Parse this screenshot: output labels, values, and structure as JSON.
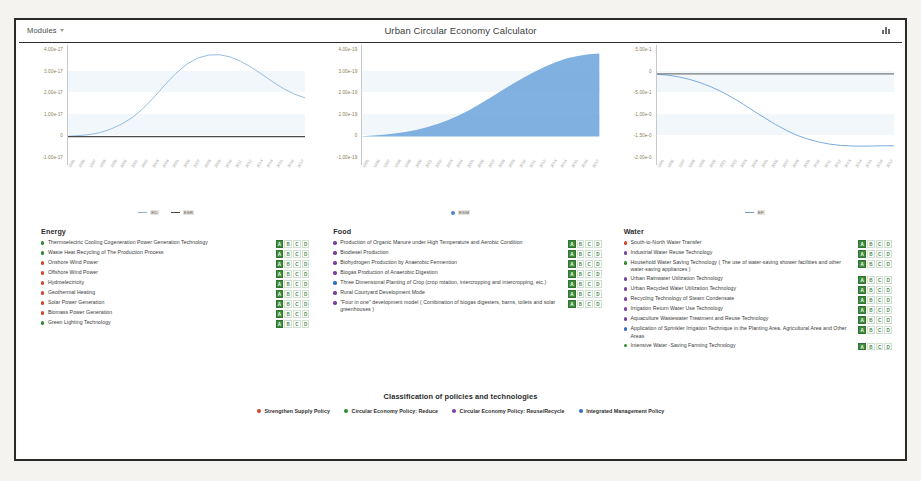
{
  "window": {
    "modules_label": "Modules",
    "title": "Urban Circular Economy Calculator",
    "topright_icon": "chart-icon"
  },
  "chart_data": [
    {
      "type": "line",
      "title": "",
      "xlabel": "",
      "ylabel": "",
      "ytick_labels": [
        "4.00e-17",
        "3.00e-17",
        "2.00e-17",
        "1.00e-17",
        "0",
        "-1.00e-17"
      ],
      "ylim": [
        -1e-17,
        4.3e-17
      ],
      "x": [
        "1995",
        "1996",
        "1997",
        "1998",
        "1999",
        "2000",
        "2001",
        "2002",
        "2003",
        "2004",
        "2005",
        "2006",
        "2007",
        "2008",
        "2009",
        "2010",
        "2011",
        "2012",
        "2013",
        "2014",
        "2015",
        "2016",
        "2017"
      ],
      "legend": [
        {
          "name": "ED",
          "color": "#8ab4dd",
          "marker": "line"
        },
        {
          "name": "ESR",
          "color": "#4a4a4a",
          "marker": "line"
        }
      ],
      "series": [
        {
          "name": "ED",
          "color": "#8ab4dd",
          "values": [
            2e-19,
            5e-19,
            1e-18,
            2e-18,
            3.8e-18,
            6.2e-18,
            9.5e-18,
            1.4e-17,
            1.95e-17,
            2.55e-17,
            3.1e-17,
            3.55e-17,
            3.85e-17,
            4e-17,
            4.02e-17,
            3.92e-17,
            3.7e-17,
            3.4e-17,
            3.05e-17,
            2.68e-17,
            2.35e-17,
            2.08e-17,
            1.9e-17
          ]
        },
        {
          "name": "ESR",
          "color": "#4a4a4a",
          "values": [
            0,
            0,
            0,
            0,
            0,
            0,
            0,
            0,
            0,
            0,
            0,
            0,
            0,
            0,
            0,
            0,
            0,
            0,
            0,
            0,
            0,
            0,
            0
          ]
        }
      ],
      "grid": false,
      "legend_position": "bottom"
    },
    {
      "type": "area",
      "title": "",
      "xlabel": "",
      "ylabel": "",
      "ytick_labels": [
        "4.00e-19",
        "3.00e-19",
        "2.00e-19",
        "1.00e-19",
        "0",
        "-1.00e-19"
      ],
      "ylim": [
        -1e-19,
        4.3e-19
      ],
      "x": [
        "1995",
        "1996",
        "1997",
        "1998",
        "1999",
        "2000",
        "2001",
        "2002",
        "2003",
        "2004",
        "2005",
        "2006",
        "2007",
        "2008",
        "2009",
        "2010",
        "2011",
        "2012",
        "2013",
        "2014",
        "2015",
        "2016",
        "2017"
      ],
      "legend": [
        {
          "name": "ESM",
          "color": "#4a86c8",
          "marker": "dot"
        }
      ],
      "series": [
        {
          "name": "ESM",
          "color": "#6ba3da",
          "values": [
            2e-21,
            5e-21,
            9e-21,
            1.5e-20,
            2.3e-20,
            3.3e-20,
            4.6e-20,
            6.2e-20,
            8.2e-20,
            1.05e-19,
            1.32e-19,
            1.62e-19,
            1.95e-19,
            2.28e-19,
            2.6e-19,
            2.9e-19,
            3.18e-19,
            3.44e-19,
            3.66e-19,
            3.84e-19,
            3.96e-19,
            4.04e-19,
            4.08e-19
          ]
        }
      ],
      "grid": false,
      "legend_position": "bottom"
    },
    {
      "type": "line",
      "title": "",
      "xlabel": "",
      "ylabel": "",
      "ytick_labels": [
        "5.00e-1",
        "0",
        "-5.00e-1",
        "-1.00e-0",
        "-1.50e-0",
        "-2.00e-0"
      ],
      "ylim": [
        -2.0,
        0.6
      ],
      "x": [
        "1995",
        "1996",
        "1997",
        "1998",
        "1999",
        "2000",
        "2001",
        "2002",
        "2003",
        "2004",
        "2005",
        "2006",
        "2007",
        "2008",
        "2009",
        "2010",
        "2011",
        "2012",
        "2013",
        "2014",
        "2015",
        "2016",
        "2017"
      ],
      "legend": [
        {
          "name": "EF",
          "color": "#6b9bd2",
          "marker": "line"
        }
      ],
      "series": [
        {
          "name": "EF",
          "color": "#6ba3da",
          "values": [
            -0.01,
            -0.03,
            -0.07,
            -0.13,
            -0.21,
            -0.31,
            -0.43,
            -0.57,
            -0.73,
            -0.9,
            -1.06,
            -1.22,
            -1.36,
            -1.48,
            -1.57,
            -1.64,
            -1.69,
            -1.72,
            -1.735,
            -1.74,
            -1.735,
            -1.73,
            -1.73
          ]
        },
        {
          "name": "zero-baseline",
          "color": "#7a7a7a",
          "values": [
            0,
            0,
            0,
            0,
            0,
            0,
            0,
            0,
            0,
            0,
            0,
            0,
            0,
            0,
            0,
            0,
            0,
            0,
            0,
            0,
            0,
            0,
            0
          ]
        }
      ],
      "grid": false,
      "legend_position": "bottom"
    }
  ],
  "categories": [
    {
      "name": "Energy",
      "items": [
        {
          "label": "Thermoelectric Cooling Cogeneration Power Generation Technology",
          "dot": "#2e8b2e",
          "badges": [
            "A",
            "B",
            "C",
            "D"
          ],
          "active": "A"
        },
        {
          "label": "Waste Heat Recycling of The Production Process",
          "dot": "#2e8b2e",
          "badges": [
            "A",
            "B",
            "C",
            "D"
          ],
          "active": "A"
        },
        {
          "label": "Onshore Wind Power",
          "dot": "#d1452b",
          "badges": [
            "A",
            "B",
            "C",
            "D"
          ],
          "active": "A"
        },
        {
          "label": "Offshore Wind Power",
          "dot": "#d1452b",
          "badges": [
            "A",
            "B",
            "C",
            "D"
          ],
          "active": "A"
        },
        {
          "label": "Hydroelectricity",
          "dot": "#d1452b",
          "badges": [
            "A",
            "B",
            "C",
            "D"
          ],
          "active": "A"
        },
        {
          "label": "Geothermal Heating",
          "dot": "#d1452b",
          "badges": [
            "A",
            "B",
            "C",
            "D"
          ],
          "active": "A"
        },
        {
          "label": "Solar Power Generation",
          "dot": "#d1452b",
          "badges": [
            "A",
            "B",
            "C",
            "D"
          ],
          "active": "A"
        },
        {
          "label": "Biomass Power Generation",
          "dot": "#d1452b",
          "badges": [
            "A",
            "B",
            "C",
            "D"
          ],
          "active": "A"
        },
        {
          "label": "Green Lighting Technology",
          "dot": "#2e8b2e",
          "badges": [
            "A",
            "B",
            "C",
            "D"
          ],
          "active": "A"
        }
      ]
    },
    {
      "name": "Food",
      "items": [
        {
          "label": "Production of Organic Manure under High Temperature and Aerobic Condition",
          "dot": "#7b3f9d",
          "badges": [
            "A",
            "B",
            "C",
            "D"
          ],
          "active": "A"
        },
        {
          "label": "Biodiesel Production",
          "dot": "#7b3f9d",
          "badges": [
            "A",
            "B",
            "C",
            "D"
          ],
          "active": "A"
        },
        {
          "label": "Biohydrogen Production by Anaerobic Fermention",
          "dot": "#7b3f9d",
          "badges": [
            "A",
            "B",
            "C",
            "D"
          ],
          "active": "A"
        },
        {
          "label": "Biogas Production of Anaerobic Digestion",
          "dot": "#7b3f9d",
          "badges": [
            "A",
            "B",
            "C",
            "D"
          ],
          "active": "A"
        },
        {
          "label": "Three Dimensional Planting of Crop (crop rotation, intercropping and intercropping, etc.)",
          "dot": "#2f6fc4",
          "badges": [
            "A",
            "B",
            "C",
            "D"
          ],
          "active": "A"
        },
        {
          "label": "Rural Courtyard Development Mode",
          "dot": "#7b3f9d",
          "badges": [
            "A",
            "B",
            "C",
            "D"
          ],
          "active": "A"
        },
        {
          "label": "\"Four in one\" development model (  Combination of biogas digesters, barns, toilets and solar greenhouses )",
          "dot": "#7b3f9d",
          "badges": [
            "A",
            "B",
            "C",
            "D"
          ],
          "active": "A"
        }
      ]
    },
    {
      "name": "Water",
      "items": [
        {
          "label": "South-to-North Water Transfer",
          "dot": "#d1452b",
          "badges": [
            "A",
            "B",
            "C",
            "D"
          ],
          "active": "A"
        },
        {
          "label": "Industrial Water Reuse Technology",
          "dot": "#7b3f9d",
          "badges": [
            "A",
            "B",
            "C",
            "D"
          ],
          "active": "A"
        },
        {
          "label": "Household Water Saving Technology ( The use of water-saving shower facilities and other water-saving appliances )",
          "dot": "#2e8b2e",
          "badges": [
            "A",
            "B",
            "C",
            "D"
          ],
          "active": "A"
        },
        {
          "label": "Urban Rainwater Utilization Technology",
          "dot": "#7b3f9d",
          "badges": [
            "A",
            "B",
            "C",
            "D"
          ],
          "active": "A"
        },
        {
          "label": "Urban Recycled Water Utilization Technology",
          "dot": "#7b3f9d",
          "badges": [
            "A",
            "B",
            "C",
            "D"
          ],
          "active": "A"
        },
        {
          "label": "Recycling Technology of Steam Condensate",
          "dot": "#7b3f9d",
          "badges": [
            "A",
            "B",
            "C",
            "D"
          ],
          "active": "A"
        },
        {
          "label": "Irrigation Return Water Use Technology",
          "dot": "#7b3f9d",
          "badges": [
            "A",
            "B",
            "C",
            "D"
          ],
          "active": "A"
        },
        {
          "label": "Aquaculture Wastewater Treatment and Reuse Technology",
          "dot": "#7b3f9d",
          "badges": [
            "A",
            "B",
            "C",
            "D"
          ],
          "active": "A"
        },
        {
          "label": "Application of Sprinkler Irrigation Technique in the Planting Area, Agricultural Area and Other Areas",
          "dot": "#2f6fc4",
          "badges": [
            "A",
            "B",
            "C",
            "D"
          ],
          "active": "A"
        },
        {
          "label": "Intensive Water -Saving Farming Technology",
          "dot": "#2e8b2e",
          "badges": [
            "A",
            "B",
            "C",
            "D"
          ],
          "active": "A"
        }
      ]
    }
  ],
  "footer": {
    "title": "Classification of policies and technologies",
    "legend": [
      {
        "label": "Strengthen Supply Policy",
        "color": "#d1452b"
      },
      {
        "label": "Circular Economy Policy: Reduce",
        "color": "#2e8b2e"
      },
      {
        "label": "Circular Economy Policy: Reuse/Recycle",
        "color": "#7b3f9d"
      },
      {
        "label": "Integrated Management Policy",
        "color": "#2f6fc4"
      }
    ]
  }
}
